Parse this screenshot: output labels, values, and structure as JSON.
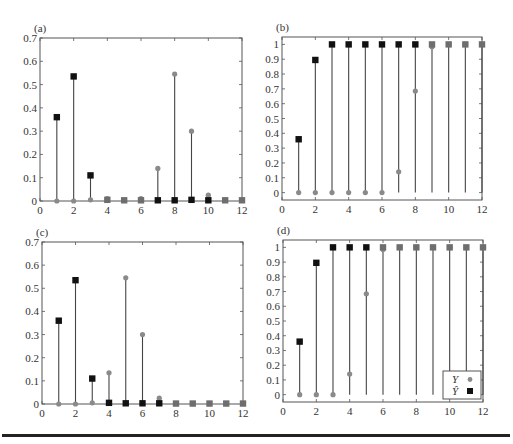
{
  "legend": {
    "y_label": "Y",
    "yhat_label": "Ŷ"
  },
  "colors": {
    "y_marker": "#8a8a8a",
    "yhat_marker": "#111111",
    "stem": "#444444",
    "axis": "#555555"
  },
  "chart_data": [
    {
      "panel": "(a)",
      "type": "stem",
      "x": [
        1,
        2,
        3,
        4,
        5,
        6,
        7,
        8,
        9,
        10,
        11,
        12
      ],
      "series": [
        {
          "name": "Y",
          "marker": "circle",
          "values": [
            0,
            0,
            0.005,
            0.01,
            0.003,
            0.01,
            0.14,
            0.545,
            0.3,
            0.025,
            0.003,
            0.003
          ]
        },
        {
          "name": "Ŷ",
          "marker": "square",
          "values": [
            0.36,
            0.535,
            0.11,
            0.005,
            0.003,
            0.003,
            0.003,
            0.003,
            0.005,
            0.003,
            0.003,
            0.003
          ]
        }
      ],
      "xlim": [
        0,
        12
      ],
      "ylim": [
        0,
        0.7
      ],
      "xticks": [
        0,
        2,
        4,
        6,
        8,
        10,
        12
      ],
      "yticks": [
        0,
        0.1,
        0.2,
        0.3,
        0.4,
        0.5,
        0.6,
        0.7
      ],
      "grid": false
    },
    {
      "panel": "(b)",
      "type": "stem",
      "x": [
        1,
        2,
        3,
        4,
        5,
        6,
        7,
        8,
        9,
        10,
        11,
        12
      ],
      "series": [
        {
          "name": "Y",
          "marker": "circle",
          "values": [
            0,
            0,
            0,
            0,
            0,
            0,
            0.14,
            0.685,
            0.985,
            1,
            1,
            1
          ]
        },
        {
          "name": "Ŷ",
          "marker": "square",
          "values": [
            0.36,
            0.895,
            1,
            1,
            1,
            1,
            1,
            1,
            1,
            1,
            1,
            1
          ]
        }
      ],
      "xlim": [
        0,
        12
      ],
      "ylim": [
        -0.05,
        1.05
      ],
      "xticks": [
        0,
        2,
        4,
        6,
        8,
        10,
        12
      ],
      "yticks": [
        0,
        0.1,
        0.2,
        0.3,
        0.4,
        0.5,
        0.6,
        0.7,
        0.8,
        0.9,
        1
      ],
      "grid": false
    },
    {
      "panel": "(c)",
      "type": "stem",
      "x": [
        1,
        2,
        3,
        4,
        5,
        6,
        7,
        8,
        9,
        10,
        11,
        12
      ],
      "series": [
        {
          "name": "Y",
          "marker": "circle",
          "values": [
            0,
            0,
            0.005,
            0.135,
            0.545,
            0.3,
            0.025,
            0.002,
            0.002,
            0.002,
            0.002,
            0.002
          ]
        },
        {
          "name": "Ŷ",
          "marker": "square",
          "values": [
            0.36,
            0.535,
            0.11,
            0.005,
            0.003,
            0.003,
            0.003,
            0.002,
            0.002,
            0.002,
            0.002,
            0.002
          ]
        }
      ],
      "xlim": [
        0,
        12
      ],
      "ylim": [
        0,
        0.7
      ],
      "xticks": [
        0,
        2,
        4,
        6,
        8,
        10,
        12
      ],
      "yticks": [
        0,
        0.1,
        0.2,
        0.3,
        0.4,
        0.5,
        0.6,
        0.7
      ],
      "grid": false
    },
    {
      "panel": "(d)",
      "type": "stem",
      "x": [
        1,
        2,
        3,
        4,
        5,
        6,
        7,
        8,
        9,
        10,
        11,
        12
      ],
      "series": [
        {
          "name": "Y",
          "marker": "circle",
          "values": [
            0,
            0,
            0,
            0.14,
            0.685,
            0.985,
            1,
            1,
            1,
            1,
            1,
            1
          ]
        },
        {
          "name": "Ŷ",
          "marker": "square",
          "values": [
            0.36,
            0.895,
            1,
            1,
            1,
            1,
            1,
            1,
            1,
            1,
            1,
            1
          ]
        }
      ],
      "xlim": [
        0,
        12
      ],
      "ylim": [
        -0.05,
        1.05
      ],
      "xticks": [
        0,
        2,
        4,
        6,
        8,
        10,
        12
      ],
      "yticks": [
        0,
        0.1,
        0.2,
        0.3,
        0.4,
        0.5,
        0.6,
        0.7,
        0.8,
        0.9,
        1
      ],
      "grid": false,
      "legend": {
        "position": "lower right",
        "entries": [
          "Y",
          "Ŷ"
        ]
      }
    }
  ],
  "layout": [
    {
      "left": 40,
      "right": 242,
      "top": 38,
      "bottom": 201
    },
    {
      "left": 282,
      "right": 482,
      "top": 37,
      "bottom": 200
    },
    {
      "left": 42,
      "right": 243,
      "top": 242,
      "bottom": 404
    },
    {
      "left": 283,
      "right": 483,
      "top": 240,
      "bottom": 402
    }
  ]
}
